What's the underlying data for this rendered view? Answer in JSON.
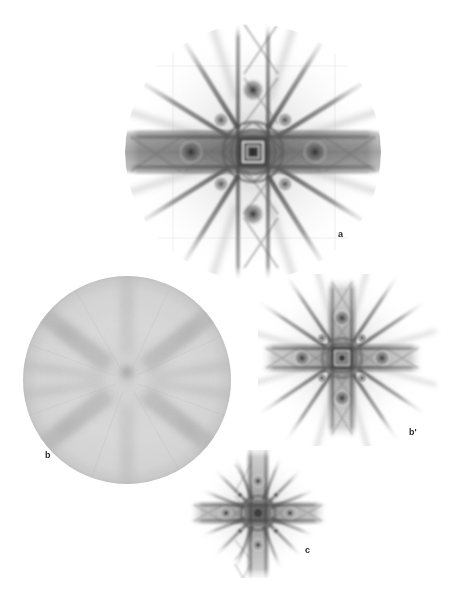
{
  "figure": {
    "background_color": "#ffffff",
    "width": 451,
    "height": 601,
    "ink_color": "#3a3a3a"
  },
  "panels": [
    {
      "id": "a",
      "label": "a",
      "kind": "laue-star-pattern",
      "description": "Large circular Laue diffraction pattern with 4-fold symmetry, strong horizontal and vertical bars and eight diagonal streaks",
      "center": {
        "x": 253,
        "y": 152
      },
      "radius": 128,
      "label_position": {
        "x": 338,
        "y": 230
      },
      "rays": 8,
      "bar_count": 4,
      "core": "concentric-squares"
    },
    {
      "id": "b",
      "label": "b",
      "kind": "powder-disc",
      "description": "Large uniform grey disc with faint radial spokes crossing in an X and a dark central spot",
      "center": {
        "x": 127,
        "y": 380
      },
      "radius": 104,
      "label_position": {
        "x": 45,
        "y": 451
      },
      "spokes": 4,
      "disc_tone": "#d8d8d8",
      "spoke_tone": "#b4b4b4",
      "center_spot": {
        "x": 127,
        "y": 372,
        "r": 9,
        "tone": "#9a9a9a"
      }
    },
    {
      "id": "b-prime",
      "label": "b'",
      "kind": "laue-star-pattern",
      "description": "Medium Laue diffraction pattern, same symmetry as panel a at reduced scale",
      "center": {
        "x": 342,
        "y": 358
      },
      "radius": 82,
      "label_position": {
        "x": 409,
        "y": 432
      },
      "rays": 8,
      "bar_count": 4,
      "core": "concentric-squares"
    },
    {
      "id": "c",
      "label": "c",
      "kind": "laue-star-pattern",
      "description": "Small compact Laue diffraction pattern, cross plus twelve short spikes",
      "center": {
        "x": 258,
        "y": 513
      },
      "radius": 62,
      "label_position": {
        "x": 305,
        "y": 551
      },
      "rays": 12,
      "bar_count": 4,
      "core": "concentric-rings"
    }
  ]
}
